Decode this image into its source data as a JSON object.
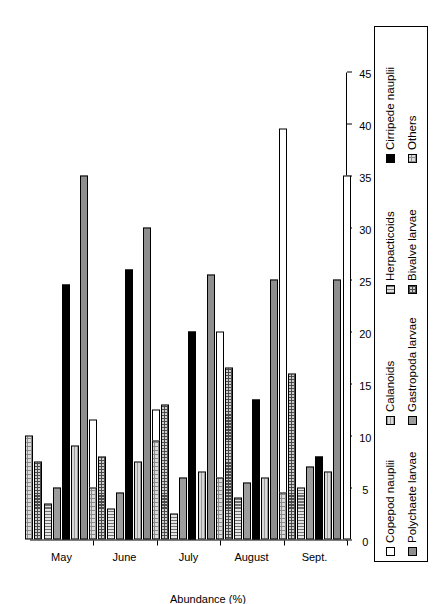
{
  "chart_data": {
    "type": "bar",
    "orientation": "horizontal-grouped-rotated",
    "title": "",
    "xlabel": "",
    "ylabel": "Abundance (%)",
    "categories": [
      "May",
      "June",
      "July",
      "August",
      "Sept."
    ],
    "ylim": [
      0,
      45
    ],
    "yticks": [
      0,
      5,
      10,
      15,
      20,
      25,
      30,
      35,
      40,
      45
    ],
    "grid": false,
    "legend_position": "right-rotated",
    "series": [
      {
        "name": "Copepod nauplii",
        "pattern": "white",
        "values": [
          11.5,
          12.5,
          20.0,
          39.5,
          35.0
        ]
      },
      {
        "name": "Polychaete larvae",
        "pattern": "gray",
        "values": [
          35.0,
          30.0,
          25.5,
          25.0,
          25.0
        ]
      },
      {
        "name": "Calanoids",
        "pattern": "ltgray",
        "values": [
          9.0,
          7.5,
          6.5,
          6.0,
          6.5
        ]
      },
      {
        "name": "Cirripede nauplii",
        "pattern": "black",
        "values": [
          24.5,
          26.0,
          20.0,
          13.5,
          8.0
        ]
      },
      {
        "name": "Gastropoda larvae",
        "pattern": "medgray",
        "values": [
          5.0,
          4.5,
          6.0,
          5.5,
          7.0
        ]
      },
      {
        "name": "Herpacticoids",
        "pattern": "vert",
        "values": [
          3.5,
          3.0,
          2.5,
          4.0,
          5.0
        ]
      },
      {
        "name": "Bivalve larvae",
        "pattern": "check",
        "values": [
          7.5,
          8.0,
          13.0,
          16.5,
          16.0
        ]
      },
      {
        "name": "Others",
        "pattern": "dot",
        "values": [
          10.0,
          5.0,
          9.5,
          6.0,
          4.5
        ]
      }
    ]
  },
  "legend": {
    "rows": [
      [
        {
          "label": "Copepod nauplii",
          "pattern": "white"
        },
        {
          "label": "Calanoids",
          "pattern": "ltgray"
        },
        {
          "label": "Herpacticoids",
          "pattern": "vert"
        },
        {
          "label": "Cirripede nauplii",
          "pattern": "black"
        }
      ],
      [
        {
          "label": "Polychaete larvae",
          "pattern": "gray"
        },
        {
          "label": "Gastropoda larvae",
          "pattern": "medgray"
        },
        {
          "label": "Bivalve larvae",
          "pattern": "check"
        },
        {
          "label": "Others",
          "pattern": "dot"
        }
      ]
    ]
  }
}
